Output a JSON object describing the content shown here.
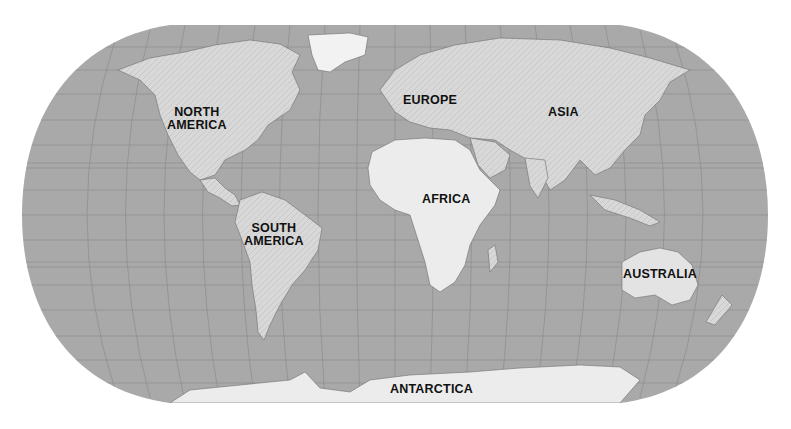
{
  "map": {
    "projection": "robinson",
    "colors": {
      "ocean": "#a9a9a9",
      "land": "#d6d6d6",
      "land_light": "#ededed",
      "ice": "#f4f4f4",
      "graticule": "#8c8c8c",
      "label": "#111111",
      "background": "#ffffff"
    },
    "labels": [
      {
        "id": "north-america",
        "text": "NORTH\nAMERICA"
      },
      {
        "id": "europe",
        "text": "EUROPE"
      },
      {
        "id": "asia",
        "text": "ASIA"
      },
      {
        "id": "africa",
        "text": "AFRICA"
      },
      {
        "id": "south-america",
        "text": "SOUTH\nAMERICA"
      },
      {
        "id": "australia",
        "text": "AUSTRALIA"
      },
      {
        "id": "antarctica",
        "text": "ANTARCTICA"
      }
    ]
  }
}
